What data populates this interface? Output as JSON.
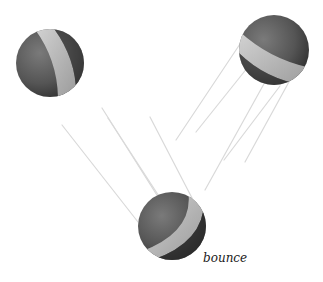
{
  "illustration": {
    "caption": "bounce",
    "colors": {
      "background": "#ffffff",
      "ball_dark": "#3a3a3a",
      "ball_mid": "#6e6e6e",
      "stripe": "#c8c8c8",
      "streak": "#d6d6d6"
    },
    "balls": [
      {
        "name": "ball-left",
        "cx": 50,
        "cy": 63,
        "r": 34
      },
      {
        "name": "ball-right",
        "cx": 274,
        "cy": 50,
        "r": 35
      },
      {
        "name": "ball-bottom",
        "cx": 172,
        "cy": 226,
        "r": 34
      }
    ]
  }
}
